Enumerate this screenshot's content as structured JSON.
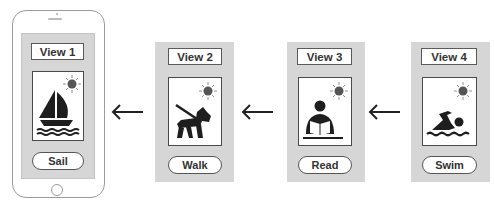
{
  "views": [
    {
      "title": "View 1",
      "action": "Sail",
      "icon": "sailboat-icon"
    },
    {
      "title": "View 2",
      "action": "Walk",
      "icon": "dog-walking-icon"
    },
    {
      "title": "View 3",
      "action": "Read",
      "icon": "person-reading-icon"
    },
    {
      "title": "View 4",
      "action": "Swim",
      "icon": "swimmer-icon"
    }
  ],
  "arrows": [
    "left-arrow",
    "left-arrow",
    "left-arrow"
  ],
  "colors": {
    "panel_bg": "#d6d6d6",
    "border": "#4a4a4a",
    "icon": "#1e1e1e",
    "sun": "#555555"
  }
}
